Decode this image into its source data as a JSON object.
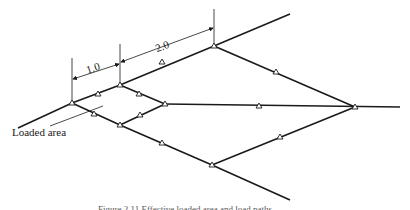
{
  "figure": {
    "dimensions": [
      {
        "label": "1.0"
      },
      {
        "label": "2.0"
      }
    ],
    "annotation": "Loaded area",
    "caption": "Figure 2.11 Effective loaded area and load paths"
  },
  "colors": {
    "line": "#1a1a1a",
    "background": "#ffffff"
  }
}
